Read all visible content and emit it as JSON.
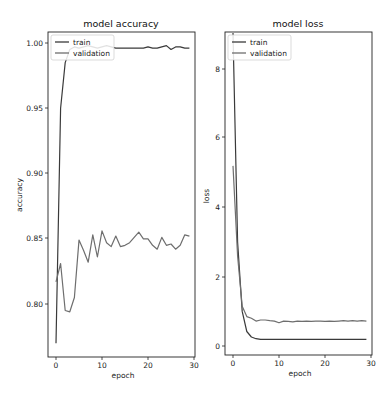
{
  "chart_data": [
    {
      "type": "line",
      "title": "model accuracy",
      "xlabel": "epoch",
      "ylabel": "accuracy",
      "xlim": [
        -1.5,
        30.5
      ],
      "ylim": [
        0.761,
        1.009
      ],
      "xticks": [
        "0",
        "10",
        "20",
        "30"
      ],
      "yticks": [
        "0.80",
        "0.85",
        "0.90",
        "0.95",
        "1.00"
      ],
      "legend": {
        "position": "upper left",
        "entries": [
          "train",
          "validation"
        ]
      },
      "grid": false,
      "x": [
        0,
        1,
        2,
        3,
        4,
        5,
        6,
        7,
        8,
        9,
        10,
        11,
        12,
        13,
        14,
        15,
        16,
        17,
        18,
        19,
        20,
        21,
        22,
        23,
        24,
        25,
        26,
        27,
        28,
        29
      ],
      "series": [
        {
          "name": "train",
          "color": "#3a3a3a",
          "values": [
            0.77,
            0.95,
            0.985,
            0.995,
            0.997,
            0.996,
            0.997,
            0.998,
            0.997,
            0.996,
            0.997,
            0.998,
            0.997,
            0.996,
            0.996,
            0.996,
            0.996,
            0.996,
            0.996,
            0.996,
            0.997,
            0.996,
            0.996,
            0.997,
            0.998,
            0.995,
            0.997,
            0.997,
            0.996,
            0.996
          ]
        },
        {
          "name": "validation",
          "color": "#6e6e6e",
          "values": [
            0.817,
            0.831,
            0.795,
            0.794,
            0.805,
            0.849,
            0.841,
            0.832,
            0.853,
            0.836,
            0.856,
            0.847,
            0.844,
            0.852,
            0.844,
            0.845,
            0.847,
            0.851,
            0.855,
            0.85,
            0.85,
            0.845,
            0.842,
            0.851,
            0.845,
            0.846,
            0.842,
            0.845,
            0.853,
            0.852
          ]
        }
      ]
    },
    {
      "type": "line",
      "title": "model loss",
      "xlabel": "epoch",
      "ylabel": "loss",
      "xlim": [
        -1.5,
        30.5
      ],
      "ylim": [
        -0.25,
        9.3
      ],
      "xticks": [
        "0",
        "10",
        "20",
        "30"
      ],
      "yticks": [
        "0",
        "2",
        "4",
        "6",
        "8"
      ],
      "legend": {
        "position": "upper left",
        "entries": [
          "train",
          "validation"
        ]
      },
      "grid": false,
      "x": [
        0,
        1,
        2,
        3,
        4,
        5,
        6,
        7,
        8,
        9,
        10,
        11,
        12,
        13,
        14,
        15,
        16,
        17,
        18,
        19,
        20,
        21,
        22,
        23,
        24,
        25,
        26,
        27,
        28,
        29
      ],
      "series": [
        {
          "name": "train",
          "color": "#3a3a3a",
          "values": [
            9.3,
            3.0,
            1.0,
            0.42,
            0.26,
            0.21,
            0.19,
            0.19,
            0.19,
            0.19,
            0.19,
            0.19,
            0.19,
            0.19,
            0.19,
            0.19,
            0.19,
            0.19,
            0.19,
            0.19,
            0.19,
            0.19,
            0.19,
            0.19,
            0.19,
            0.19,
            0.19,
            0.19,
            0.19,
            0.19
          ]
        },
        {
          "name": "validation",
          "color": "#6e6e6e",
          "values": [
            5.2,
            2.6,
            1.15,
            0.85,
            0.8,
            0.72,
            0.75,
            0.75,
            0.73,
            0.72,
            0.67,
            0.72,
            0.71,
            0.7,
            0.72,
            0.71,
            0.72,
            0.71,
            0.72,
            0.72,
            0.71,
            0.72,
            0.71,
            0.72,
            0.73,
            0.72,
            0.73,
            0.72,
            0.73,
            0.72
          ]
        }
      ]
    }
  ],
  "plots": [
    {
      "title": "model accuracy",
      "xlabel": "epoch",
      "ylabel": "accuracy",
      "xticks": [
        "0",
        "10",
        "20",
        "30"
      ],
      "yticks": [
        "1.00",
        "0.95",
        "0.90",
        "0.85",
        "0.80"
      ],
      "legend": [
        "train",
        "validation"
      ]
    },
    {
      "title": "model loss",
      "xlabel": "epoch",
      "ylabel": "loss",
      "xticks": [
        "0",
        "10",
        "20",
        "30"
      ],
      "yticks": [
        "8",
        "6",
        "4",
        "2",
        "0"
      ],
      "legend": [
        "train",
        "validation"
      ]
    }
  ]
}
